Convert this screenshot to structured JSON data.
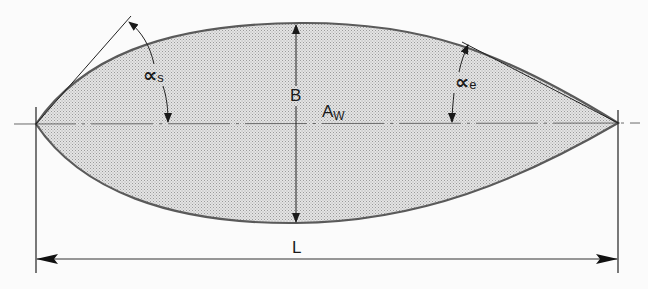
{
  "diagram": {
    "type": "waterplane-area-dimension-drawing",
    "colors": {
      "background": "#fbfbfb",
      "fill": "#d9d9d9",
      "outline": "#5a5a5a",
      "lines": "#222222"
    },
    "labels": {
      "alpha_start": {
        "symbol": "∝",
        "subscript": "s"
      },
      "alpha_end": {
        "symbol": "∝",
        "subscript": "e"
      },
      "beam": "B",
      "waterplane_area": {
        "main": "A",
        "subscript": "W"
      },
      "length": "L"
    }
  }
}
